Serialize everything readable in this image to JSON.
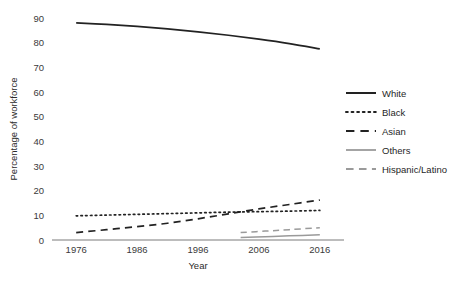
{
  "chart_data": {
    "type": "line",
    "title": "",
    "xlabel": "Year",
    "ylabel": "Percentage of workforce",
    "xlim": [
      1974,
      2018
    ],
    "ylim": [
      0,
      90
    ],
    "yticks": [
      0,
      10,
      20,
      30,
      40,
      50,
      60,
      70,
      80,
      90
    ],
    "xticks": [
      1976,
      1986,
      1996,
      2006,
      2016
    ],
    "grid": false,
    "legend_position": "right",
    "series": [
      {
        "name": "White",
        "style": "solid",
        "color": "#222222",
        "x": [
          1976,
          1981,
          1986,
          1991,
          1996,
          2001,
          2006,
          2011,
          2016
        ],
        "values": [
          88,
          87.4,
          86.6,
          85.6,
          84.4,
          83.0,
          81.4,
          79.6,
          77.5
        ]
      },
      {
        "name": "Black",
        "style": "dotted",
        "color": "#222222",
        "x": [
          1976,
          1981,
          1986,
          1991,
          1996,
          2001,
          2006,
          2011,
          2016
        ],
        "values": [
          9.8,
          10.1,
          10.4,
          10.7,
          11.0,
          11.3,
          11.5,
          11.7,
          12.0
        ]
      },
      {
        "name": "Asian",
        "style": "dashed",
        "color": "#222222",
        "x": [
          1976,
          1981,
          1986,
          1991,
          1996,
          2001,
          2006,
          2011,
          2016
        ],
        "values": [
          3.0,
          4.2,
          5.4,
          6.8,
          8.6,
          10.6,
          12.6,
          14.4,
          16.2
        ]
      },
      {
        "name": "Others",
        "style": "solid",
        "color": "#9a9a9a",
        "x": [
          2003,
          2007,
          2011,
          2016
        ],
        "values": [
          1.0,
          1.3,
          1.7,
          2.1
        ]
      },
      {
        "name": "Hispanic/Latino",
        "style": "dashed",
        "color": "#9a9a9a",
        "x": [
          2003,
          2007,
          2011,
          2016
        ],
        "values": [
          3.0,
          3.6,
          4.2,
          5.0
        ]
      }
    ]
  },
  "legend": {
    "items": [
      {
        "label": "White"
      },
      {
        "label": "Black"
      },
      {
        "label": "Asian"
      },
      {
        "label": "Others"
      },
      {
        "label": "Hispanic/Latino"
      }
    ]
  },
  "axes": {
    "y_title": "Percentage of workforce",
    "x_title": "Year",
    "y_tick_labels": [
      "90",
      "80",
      "70",
      "60",
      "50",
      "40",
      "30",
      "20",
      "10",
      "0"
    ],
    "x_tick_labels": [
      "1976",
      "1986",
      "1996",
      "2006",
      "2016"
    ]
  }
}
